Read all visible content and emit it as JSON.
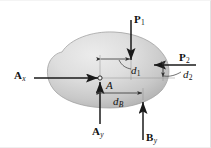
{
  "figure": {
    "type": "free-body-diagram",
    "caption": "",
    "body": {
      "name": "rigid-body-blob",
      "fill_light": "#e4e4e4",
      "fill_mid": "#cfcfcf",
      "fill_dark": "#b4b4b4",
      "outline": "#9a9a9a"
    },
    "point": {
      "label": "A",
      "x": 100,
      "y": 78
    },
    "forces": [
      {
        "name": "force-P1",
        "label": "P",
        "subscript": "1",
        "direction": "down",
        "tail_x": 131,
        "tail_y": 20,
        "head_x": 131,
        "head_y": 62,
        "label_x": 134,
        "label_y": 15
      },
      {
        "name": "force-P2",
        "label": "P",
        "subscript": "2",
        "direction": "left",
        "tail_x": 196,
        "tail_y": 65,
        "head_x": 152,
        "head_y": 65,
        "label_x": 179,
        "label_y": 53
      },
      {
        "name": "reaction-Ax",
        "label": "A",
        "subscript": "x",
        "direction": "right",
        "tail_x": 34,
        "tail_y": 78,
        "head_x": 100,
        "head_y": 78,
        "label_x": 14,
        "label_y": 71
      },
      {
        "name": "reaction-Ay",
        "label": "A",
        "subscript": "y",
        "direction": "up",
        "tail_x": 100,
        "tail_y": 124,
        "head_x": 100,
        "head_y": 80,
        "label_x": 93,
        "label_y": 127
      },
      {
        "name": "reaction-By",
        "label": "B",
        "subscript": "y",
        "direction": "up",
        "tail_x": 143,
        "tail_y": 140,
        "head_x": 143,
        "head_y": 100,
        "label_x": 147,
        "label_y": 133
      }
    ],
    "dimensions": [
      {
        "name": "dimension-d1",
        "label": "d",
        "subscript": "1",
        "orientation": "horizontal",
        "from_x": 100,
        "from_y": 59,
        "to_x": 131,
        "to_y": 59,
        "label_x": 128,
        "label_y": 66
      },
      {
        "name": "dimension-d2",
        "label": "d",
        "subscript": "2",
        "orientation": "vertical",
        "from_x": 163,
        "from_y": 65,
        "to_x": 163,
        "to_y": 78,
        "label_x": 185,
        "label_y": 71
      },
      {
        "name": "dimension-dB",
        "label": "d",
        "subscript": "B",
        "orientation": "horizontal",
        "from_x": 100,
        "from_y": 93,
        "to_x": 143,
        "to_y": 93,
        "label_x": 112,
        "label_y": 96
      }
    ],
    "colors": {
      "ink": "#111111",
      "line": "#1a1a1a",
      "thin_line": "#555555",
      "background": "#ffffff",
      "frame": "#e2e2e2"
    }
  }
}
